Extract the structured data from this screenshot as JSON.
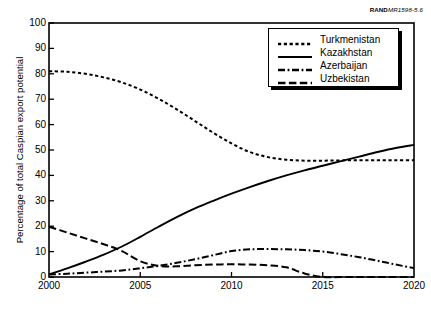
{
  "credit": {
    "brand": "RAND",
    "doc_id": "MR1598-5.6"
  },
  "legend": {
    "position": "top-right",
    "entries": [
      {
        "label": "Turkmenistan",
        "style": "dotted"
      },
      {
        "label": "Kazakhstan",
        "style": "solid"
      },
      {
        "label": "Azerbaijan",
        "style": "dash-dot"
      },
      {
        "label": "Uzbekistan",
        "style": "dashed"
      }
    ]
  },
  "axes": {
    "y_title": "Percentage of total Caspian export potential",
    "y_ticks": [
      "100",
      "90",
      "80",
      "70",
      "60",
      "50",
      "40",
      "30",
      "20",
      "10",
      "0"
    ],
    "x_ticks": [
      "2000",
      "2005",
      "2010",
      "2015",
      "2020"
    ]
  },
  "chart_data": {
    "type": "line",
    "title": "",
    "subtitle": "",
    "xlabel": "",
    "ylabel": "Percentage of total Caspian export potential",
    "xlim": [
      2000,
      2020
    ],
    "ylim": [
      0,
      100
    ],
    "ytick_step": 10,
    "xtick_step": 5,
    "grid": false,
    "legend_position": "top-right",
    "x": [
      2000,
      2001,
      2002,
      2003,
      2004,
      2005,
      2006,
      2007,
      2008,
      2009,
      2010,
      2011,
      2012,
      2013,
      2014,
      2015,
      2016,
      2017,
      2018,
      2019,
      2020
    ],
    "series": [
      {
        "name": "Turkmenistan",
        "line_style": "dotted",
        "color": "#000000",
        "values": [
          81,
          80.8,
          80,
          78.6,
          76.6,
          73.8,
          70.2,
          66,
          61.4,
          56.8,
          52.6,
          49.2,
          47.2,
          46.2,
          45.8,
          45.8,
          45.9,
          46,
          46,
          46,
          46
        ]
      },
      {
        "name": "Kazakhstan",
        "line_style": "solid",
        "color": "#000000",
        "values": [
          1,
          3.4,
          6,
          8.8,
          12,
          15.8,
          19.8,
          23.6,
          27,
          30,
          32.8,
          35.4,
          37.8,
          40,
          42,
          43.8,
          45.6,
          47.4,
          49.2,
          50.8,
          52
        ]
      },
      {
        "name": "Azerbaijan",
        "line_style": "dash-dot",
        "color": "#000000",
        "values": [
          1,
          1.3,
          1.7,
          2.1,
          2.6,
          3.4,
          4.4,
          5.6,
          7,
          8.6,
          10.2,
          10.9,
          11,
          10.9,
          10.6,
          10,
          9,
          7.8,
          6.4,
          4.9,
          3.5
        ]
      },
      {
        "name": "Uzbekistan",
        "line_style": "dashed",
        "color": "#000000",
        "values": [
          19.8,
          17.5,
          15.2,
          12.9,
          10.2,
          6.2,
          4.4,
          4.2,
          4.6,
          4.9,
          5,
          4.9,
          4.6,
          3.8,
          1.4,
          0,
          0,
          0,
          0,
          0,
          0
        ]
      }
    ]
  },
  "plot_geometry": {
    "left": 49,
    "top": 23,
    "right": 414,
    "bottom": 277
  }
}
